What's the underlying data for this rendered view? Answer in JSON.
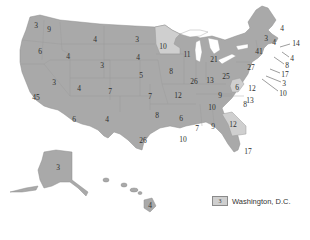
{
  "map": {
    "type": "choropleth",
    "subject": "United States electoral votes by state",
    "colors": {
      "default_fill": "#a9a9a9",
      "highlight_fill": "#cfcfcf",
      "label_color": "#2e2e2e",
      "background": "#ffffff"
    },
    "highlighted_states": [
      "MN",
      "GA",
      "DC"
    ],
    "states": [
      {
        "abbr": "WA",
        "value": "9"
      },
      {
        "abbr": "WA-OR-coast",
        "value": "3"
      },
      {
        "abbr": "OR",
        "value": "6"
      },
      {
        "abbr": "CA",
        "value": "45"
      },
      {
        "abbr": "NV",
        "value": "3"
      },
      {
        "abbr": "ID",
        "value": "4"
      },
      {
        "abbr": "MT",
        "value": "4"
      },
      {
        "abbr": "WY",
        "value": "3"
      },
      {
        "abbr": "UT",
        "value": "4"
      },
      {
        "abbr": "CO",
        "value": "7"
      },
      {
        "abbr": "AZ",
        "value": "6"
      },
      {
        "abbr": "NM",
        "value": "4"
      },
      {
        "abbr": "ND",
        "value": "3"
      },
      {
        "abbr": "SD",
        "value": "4"
      },
      {
        "abbr": "NE",
        "value": "5"
      },
      {
        "abbr": "KS",
        "value": "7"
      },
      {
        "abbr": "OK",
        "value": "8"
      },
      {
        "abbr": "TX",
        "value": "26"
      },
      {
        "abbr": "MN",
        "value": "10"
      },
      {
        "abbr": "IA",
        "value": "8"
      },
      {
        "abbr": "MO",
        "value": "12"
      },
      {
        "abbr": "AR",
        "value": "6"
      },
      {
        "abbr": "LA",
        "value": "10"
      },
      {
        "abbr": "WI",
        "value": "11"
      },
      {
        "abbr": "IL",
        "value": "26"
      },
      {
        "abbr": "MI",
        "value": "21"
      },
      {
        "abbr": "IN",
        "value": "13"
      },
      {
        "abbr": "OH",
        "value": "25"
      },
      {
        "abbr": "KY",
        "value": "9"
      },
      {
        "abbr": "TN",
        "value": "10"
      },
      {
        "abbr": "MS",
        "value": "7"
      },
      {
        "abbr": "AL",
        "value": "9"
      },
      {
        "abbr": "GA",
        "value": "12"
      },
      {
        "abbr": "FL",
        "value": "17"
      },
      {
        "abbr": "SC",
        "value": "8"
      },
      {
        "abbr": "NC",
        "value": "13"
      },
      {
        "abbr": "VA",
        "value": "12"
      },
      {
        "abbr": "WV",
        "value": "6"
      },
      {
        "abbr": "PA",
        "value": "27"
      },
      {
        "abbr": "NY",
        "value": "41"
      },
      {
        "abbr": "VT",
        "value": "3"
      },
      {
        "abbr": "NH",
        "value": "4"
      },
      {
        "abbr": "ME",
        "value": "4"
      },
      {
        "abbr": "MA",
        "value": "14"
      },
      {
        "abbr": "RI",
        "value": "4"
      },
      {
        "abbr": "CT",
        "value": "8"
      },
      {
        "abbr": "NJ",
        "value": "17"
      },
      {
        "abbr": "DE",
        "value": "3"
      },
      {
        "abbr": "MD",
        "value": "10"
      },
      {
        "abbr": "AK",
        "value": "3"
      },
      {
        "abbr": "HI",
        "value": "4"
      }
    ]
  },
  "legend": {
    "swatch_value": "3",
    "label": "Washington, D.C."
  }
}
